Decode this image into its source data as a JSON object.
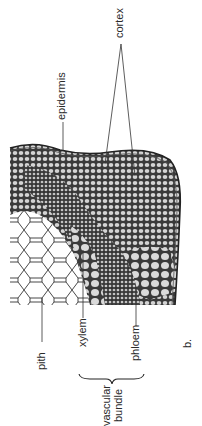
{
  "figure": {
    "panel_label": "b.",
    "labels": {
      "cortex": "cortex",
      "epidermis": "epidermis",
      "pith": "pith",
      "xylem": "xylem",
      "phloem": "phloem",
      "vascular_bundle_line1": "vascular",
      "vascular_bundle_line2": "bundle"
    },
    "colors": {
      "ink": "#2a2a2a",
      "cell_fill": "#d8d8d8",
      "pith_fill": "#ffffff",
      "background": "#ffffff"
    }
  }
}
